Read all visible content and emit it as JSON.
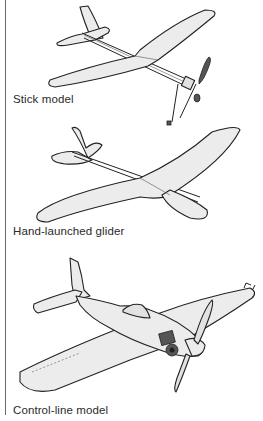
{
  "figures": [
    {
      "id": "stick",
      "label": "Stick model",
      "icon": "stick-model-plane-illustration"
    },
    {
      "id": "glider",
      "label": "Hand-launched glider",
      "icon": "hand-launched-glider-illustration"
    },
    {
      "id": "control",
      "label": "Control-line model",
      "icon": "control-line-model-plane-illustration"
    }
  ],
  "colors": {
    "line": "#222222",
    "fill": "#ececec",
    "rule": "#6a6a6a",
    "text": "#2a2a2a"
  }
}
